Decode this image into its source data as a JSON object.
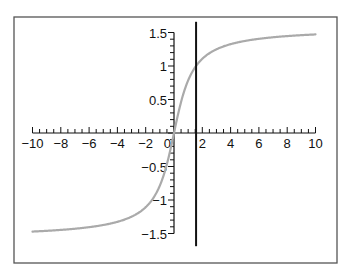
{
  "chart_data": {
    "type": "line",
    "title": "",
    "xlabel": "",
    "ylabel": "",
    "function": "y = arctan(x)",
    "xlim": [
      -10,
      10
    ],
    "ylim": [
      -1.5,
      1.5
    ],
    "grid": false,
    "legend": null,
    "x_ticks": [
      -10,
      -8,
      -6,
      -4,
      -2,
      0,
      2,
      4,
      6,
      8,
      10
    ],
    "x_tick_labels": [
      "−10",
      "−8",
      "−6",
      "−4",
      "−2",
      "0",
      "2",
      "4",
      "6",
      "8",
      "10"
    ],
    "y_ticks": [
      -1.5,
      -1,
      -0.5,
      0.5,
      1,
      1.5
    ],
    "y_tick_labels": [
      "−1.5",
      "−1",
      "−0.5",
      "0.5",
      "1",
      "1.5"
    ],
    "series": [
      {
        "name": "arctan(x)",
        "color": "#aaaaaa",
        "x": [
          -10,
          -8,
          -6,
          -4,
          -3,
          -2,
          -1.5,
          -1,
          -0.5,
          0,
          0.5,
          1,
          1.5,
          2,
          3,
          4,
          6,
          8,
          10
        ],
        "y": [
          -1.47,
          -1.45,
          -1.41,
          -1.33,
          -1.25,
          -1.11,
          -0.98,
          -0.79,
          -0.46,
          0,
          0.46,
          0.79,
          0.98,
          1.11,
          1.25,
          1.33,
          1.41,
          1.45,
          1.47
        ]
      }
    ],
    "annotations": [
      {
        "type": "vertical_line",
        "x": 1.56,
        "y_from": -1.6,
        "y_to": 1.6,
        "color": "#111111"
      }
    ]
  },
  "colors": {
    "curve": "#aaaaaa",
    "axes": "#111111",
    "frame": "#555555",
    "vertical_line": "#111111"
  }
}
